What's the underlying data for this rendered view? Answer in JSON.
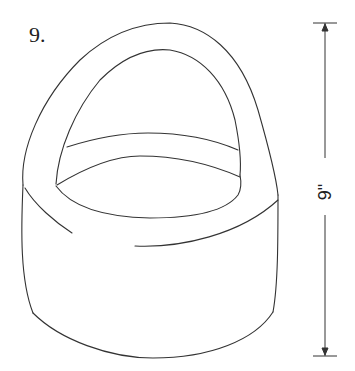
{
  "figure": {
    "number_label": "9.",
    "dimension": {
      "label": "9\"",
      "orientation": "vertical",
      "measures": "height"
    },
    "colors": {
      "line": "#333333",
      "background": "#ffffff"
    }
  }
}
